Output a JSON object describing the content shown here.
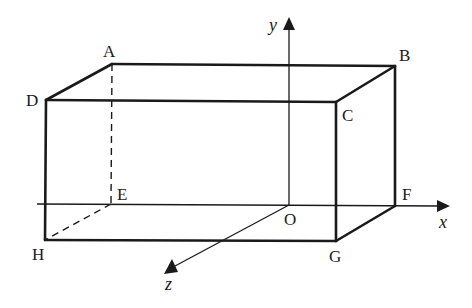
{
  "diagram": {
    "type": "3d-rectangular-box-with-axes",
    "colors": {
      "ink": "#1a1a1a",
      "background": "#ffffff"
    },
    "vertices": {
      "A": {
        "label": "A",
        "x": 112,
        "y": 64
      },
      "B": {
        "label": "B",
        "x": 395,
        "y": 66
      },
      "C": {
        "label": "C",
        "x": 336,
        "y": 102
      },
      "D": {
        "label": "D",
        "x": 46,
        "y": 100
      },
      "E": {
        "label": "E",
        "x": 111,
        "y": 204
      },
      "F": {
        "label": "F",
        "x": 395,
        "y": 206
      },
      "G": {
        "label": "G",
        "x": 336,
        "y": 241
      },
      "H": {
        "label": "H",
        "x": 45,
        "y": 240
      }
    },
    "origin": {
      "label": "O",
      "x": 289,
      "y": 205
    },
    "axes": {
      "x": {
        "label": "x"
      },
      "y": {
        "label": "y"
      },
      "z": {
        "label": "z"
      }
    },
    "visible_edges": [
      "AB",
      "AD",
      "BC",
      "DC",
      "BF",
      "CG",
      "DH",
      "HG",
      "GF"
    ],
    "hidden_edges": [
      "AE",
      "EH"
    ]
  }
}
